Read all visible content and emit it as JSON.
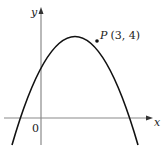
{
  "diagram": {
    "type": "graph-of-quadratic",
    "axes": {
      "x_label": "x",
      "y_label": "y",
      "origin_label": "0",
      "axis_color": "#8a8a8a"
    },
    "curve": {
      "description": "downward-opening parabola crossing x-axis at a negative and positive x, y-intercept positive",
      "color": "#111111"
    },
    "point": {
      "name": "P",
      "coords": "(3, 4)",
      "label": "P (3, 4)"
    }
  }
}
